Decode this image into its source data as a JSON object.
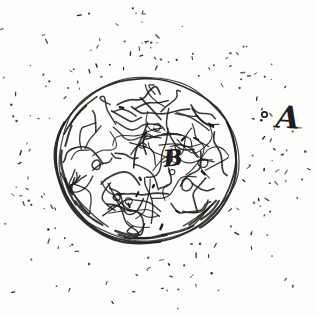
{
  "labels": {
    "body_b": "B",
    "point_a": "A"
  },
  "sketch": {
    "paper_color": "#fdfdfb",
    "ink_color": "#1e1d1b",
    "seed": 42,
    "canvas": {
      "width": 317,
      "height": 316
    },
    "sphere": {
      "cx": 146,
      "cy": 160,
      "rx": 90,
      "ry": 82
    },
    "texture": {
      "squiggles": 80,
      "loops": 8,
      "ticks": 12,
      "rim_hatches": 18
    },
    "speckles": {
      "count": 175
    },
    "point_marker": {
      "cx": 264.5,
      "cy": 114.5,
      "r": 2.7
    }
  }
}
